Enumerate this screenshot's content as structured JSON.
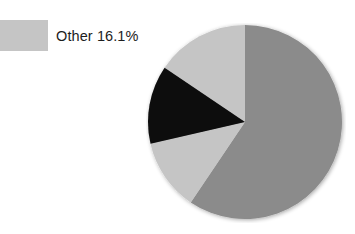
{
  "chart_data": {
    "type": "pie",
    "title": "",
    "subtitle": "",
    "xlabel": "",
    "ylabel": "",
    "grid": false,
    "legend_position": "top-left",
    "labels": [
      "Other",
      "Slice A",
      "Slice B",
      "Slice C"
    ],
    "values": [
      16.1,
      59.4,
      11.9,
      12.6
    ],
    "display_values": [
      "16.1%",
      "59.4%",
      "11.9%",
      "12.6%"
    ],
    "colors": [
      "#c5c5c5",
      "#8b8b8b",
      "#c5c5c5",
      "#0a0a0a"
    ],
    "start_angles_deg": [
      304,
      0,
      214,
      257
    ],
    "end_angles_deg": [
      360,
      214,
      257,
      304
    ],
    "center": [
      99,
      99
    ],
    "radius": 97,
    "annotations": []
  },
  "legend": {
    "entries": [
      {
        "label": "Other 16.1%",
        "swatch_color": "#c5c5c5"
      }
    ]
  },
  "colors": {
    "background": "#ffffff",
    "text": "#1d1d1d",
    "light_gray": "#c5c5c5",
    "medium_gray": "#8b8b8b",
    "black": "#0a0a0a"
  }
}
